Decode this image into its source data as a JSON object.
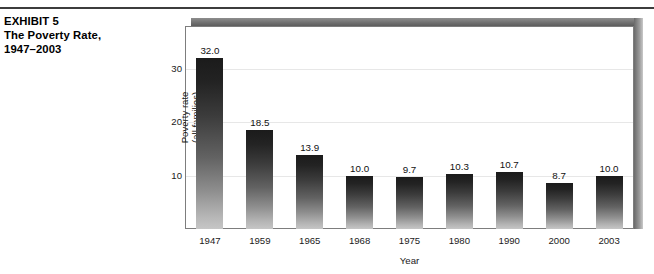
{
  "exhibit": {
    "label": "EXHIBIT 5",
    "title_line1": "The Poverty Rate,",
    "title_line2": "1947–2003"
  },
  "chart_data": {
    "type": "bar",
    "title": "",
    "subtitle": "",
    "xlabel": "Year",
    "ylabel": "Poverty rate\n(all families)",
    "ylabel_line1": "Poverty rate",
    "ylabel_line2": "(all families)",
    "categories": [
      "1947",
      "1959",
      "1965",
      "1968",
      "1975",
      "1980",
      "1990",
      "2000",
      "2003"
    ],
    "values": [
      32.0,
      18.5,
      13.9,
      10.0,
      9.7,
      10.3,
      10.7,
      8.7,
      10.0
    ],
    "value_labels": [
      "32.0",
      "18.5",
      "13.9",
      "10.0",
      "9.7",
      "10.3",
      "10.7",
      "8.7",
      "10.0"
    ],
    "ylim": [
      0,
      38
    ],
    "yticks": [
      10,
      20,
      30
    ],
    "ytick_labels": [
      "10",
      "20",
      "30"
    ],
    "grid": true,
    "legend": false,
    "bar_color_top": "#1b1b1b",
    "bar_color_bottom": "#c6c6c6",
    "gridline_color": "#e7e7e7",
    "frame_color": "#7d7d7d",
    "shadow_color": "#6e6e6e"
  }
}
